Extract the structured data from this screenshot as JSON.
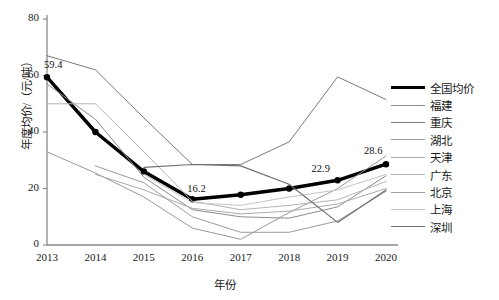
{
  "chart_data": {
    "type": "line",
    "title": "",
    "xlabel": "年份",
    "ylabel": "年度均价/（元/吨）",
    "categories": [
      "2013",
      "2014",
      "2015",
      "2016",
      "2017",
      "2018",
      "2019",
      "2020"
    ],
    "x": [
      2013,
      2014,
      2015,
      2016,
      2017,
      2018,
      2019,
      2020
    ],
    "ylim": [
      0,
      80
    ],
    "yticks": [
      "0",
      "20",
      "40",
      "60",
      "80"
    ],
    "ytick_values": [
      0,
      20,
      40,
      60,
      80
    ],
    "grid": false,
    "legend_position": "right",
    "series": [
      {
        "name": "全国均价",
        "color": "#000000",
        "width": 3.4,
        "markers": true,
        "values": [
          59.4,
          40.0,
          26.0,
          16.2,
          17.8,
          20.0,
          22.9,
          28.6
        ],
        "labels": [
          {
            "x": 2013,
            "y": 59.4,
            "text": "59.4"
          },
          {
            "x": 2016,
            "y": 16.2,
            "text": "16.2"
          },
          {
            "x": 2019,
            "y": 22.9,
            "text": "22.9"
          },
          {
            "x": 2020,
            "y": 28.6,
            "text": "28.6"
          }
        ]
      },
      {
        "name": "福建",
        "color": "#8c8c8c",
        "width": 1,
        "markers": false,
        "values": [
          57.0,
          44.5,
          24.0,
          12.5,
          10.0,
          9.5,
          13.5,
          24.5
        ]
      },
      {
        "name": "重庆",
        "color": "#7a7a7a",
        "width": 1,
        "markers": false,
        "values": [
          67.0,
          62.0,
          45.0,
          28.5,
          28.5,
          36.5,
          59.5,
          51.5
        ]
      },
      {
        "name": "湖北",
        "color": "#9a9a9a",
        "width": 1,
        "markers": false,
        "values": [
          33.0,
          25.5,
          17.0,
          6.0,
          2.0,
          11.5,
          20.0,
          31.5
        ]
      },
      {
        "name": "天津",
        "color": "#ababab",
        "width": 1,
        "markers": false,
        "values": [
          null,
          25.0,
          19.5,
          13.0,
          11.0,
          12.0,
          14.5,
          20.0
        ]
      },
      {
        "name": "广东",
        "color": "#b5b5b5",
        "width": 1,
        "markers": false,
        "values": [
          50.0,
          50.0,
          33.0,
          15.5,
          12.5,
          14.0,
          16.0,
          22.5
        ]
      },
      {
        "name": "北京",
        "color": "#9d9d9d",
        "width": 1,
        "markers": false,
        "values": [
          null,
          28.0,
          22.0,
          10.0,
          4.5,
          4.5,
          8.5,
          19.0
        ]
      },
      {
        "name": "上海",
        "color": "#c4c4c4",
        "width": 1,
        "markers": false,
        "values": [
          null,
          null,
          25.0,
          15.0,
          14.0,
          17.0,
          19.5,
          25.0
        ]
      },
      {
        "name": "深圳",
        "color": "#6f6f6f",
        "width": 1.2,
        "markers": false,
        "values": [
          null,
          null,
          27.5,
          28.5,
          28.0,
          21.5,
          8.0,
          19.5
        ]
      }
    ]
  },
  "legend": {
    "items": [
      {
        "label": "全国均价"
      },
      {
        "label": "福建"
      },
      {
        "label": "重庆"
      },
      {
        "label": "湖北"
      },
      {
        "label": "天津"
      },
      {
        "label": "广东"
      },
      {
        "label": "北京"
      },
      {
        "label": "上海"
      },
      {
        "label": "深圳"
      }
    ]
  },
  "axes": {
    "y_label": "年度均价/（元/吨）",
    "x_label": "年份",
    "y_ticks": [
      "80",
      "60",
      "40",
      "20",
      "0"
    ],
    "x_ticks": [
      "2013",
      "2014",
      "2015",
      "2016",
      "2017",
      "2018",
      "2019",
      "2020"
    ]
  }
}
